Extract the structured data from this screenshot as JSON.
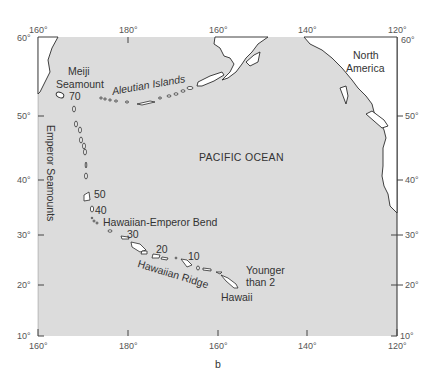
{
  "figure": {
    "caption": "b",
    "ocean_label": "PACIFIC OCEAN",
    "colors": {
      "ocean": "#dcdcdc",
      "land": "#ffffff",
      "outline": "#2b2b2b",
      "text": "#333333"
    }
  },
  "axes": {
    "top_longitudes": [
      "160°",
      "180°",
      "160°",
      "140°",
      "120°"
    ],
    "bottom_longitudes": [
      "160°",
      "180°",
      "160°",
      "140°",
      "120°"
    ],
    "left_latitudes": [
      "60°",
      "50°",
      "40°",
      "30°",
      "20°",
      "10°"
    ],
    "right_latitudes": [
      "60°",
      "50°",
      "40°",
      "30°",
      "20°",
      "10°"
    ]
  },
  "labels": {
    "north_america": [
      "North",
      "America"
    ],
    "meiji": [
      "Meiji",
      "Seamount"
    ],
    "aleutian": "Aleutian Islands",
    "emperor": "Emperor Seamounts",
    "bend": "Hawaiian-Emperor Bend",
    "ridge": "Hawaiian Ridge",
    "hawaii": "Hawaii",
    "younger": [
      "Younger",
      "than 2"
    ]
  },
  "ages": [
    "70",
    "50",
    "40",
    "30",
    "20",
    "10"
  ]
}
